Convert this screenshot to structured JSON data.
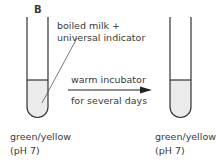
{
  "diagram": {
    "label": "B",
    "tube_annotation": [
      "boiled milk +",
      "universal indicator"
    ],
    "arrow_top": "warm incubator",
    "arrow_bottom": "for several days",
    "tube_left": {
      "color_text": "green/yellow",
      "ph_text": "(pH 7)"
    },
    "tube_right": {
      "color_text": "green/yellow",
      "ph_text": "(pH 7)"
    },
    "colors": {
      "liquid": "#ebebeb",
      "stroke": "#333333"
    }
  }
}
